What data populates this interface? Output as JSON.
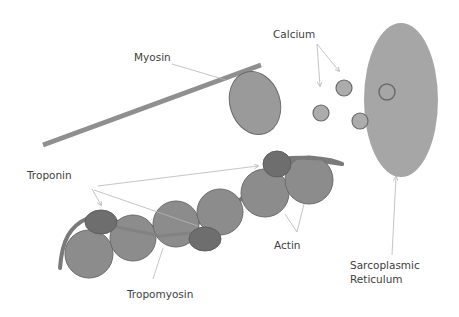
{
  "diagram": {
    "labels": {
      "myosin": "Myosin",
      "calcium": "Calcium",
      "troponin": "Troponin",
      "actin": "Actin",
      "tropomyosin": "Tropomyosin",
      "sr_line1": "Sarcoplasmic",
      "sr_line2": "Reticulum"
    },
    "colors": {
      "actin_fill": "#8c8c8c",
      "troponin_fill": "#6e6e6e",
      "myosin_fill": "#9a9a9a",
      "myosin_filament": "#8f8f8f",
      "calcium_fill": "#acacac",
      "sr_fill": "#a6a6a6",
      "outline": "#6b6b6b",
      "leader_line": "#b5b5b5",
      "text": "#404040"
    }
  }
}
